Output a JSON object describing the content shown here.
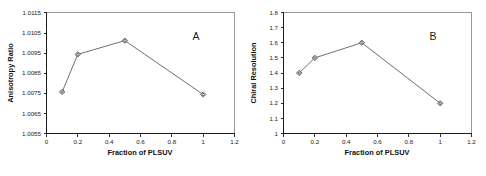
{
  "figure": {
    "width": 486,
    "height": 176,
    "background": "#ffffff",
    "line_color": "#55555a",
    "marker_color": "#4a4a50",
    "axis_color": "#1a1a1a"
  },
  "panels": [
    {
      "letter": "A",
      "name": "panel-a"
    },
    {
      "letter": "B",
      "name": "panel-b"
    }
  ],
  "chart_data": [
    {
      "type": "line",
      "title": "A",
      "xlabel": "Fraction of PLSUV",
      "ylabel": "Anisotropy Ratio",
      "xlim": [
        0,
        1.2
      ],
      "ylim": [
        1.0055,
        1.0115
      ],
      "xticks": [
        0,
        0.2,
        0.4,
        0.6,
        0.8,
        1,
        1.2
      ],
      "xticklabels": [
        "0",
        "0.2",
        "0.4",
        "0.6",
        "0.8",
        "1",
        "1.2"
      ],
      "yticks": [
        1.0055,
        1.0065,
        1.0075,
        1.0085,
        1.0095,
        1.0105,
        1.0115
      ],
      "yticklabels": [
        "1.0055",
        "1.0065",
        "1.0075",
        "1.0085",
        "1.0095",
        "1.0105",
        "1.0115"
      ],
      "grid": false,
      "legend": false,
      "marker": "open-diamond",
      "x": [
        0.1,
        0.2,
        0.5,
        1
      ],
      "values": [
        1.00757,
        1.00944,
        1.01012,
        1.00744
      ]
    },
    {
      "type": "line",
      "title": "B",
      "xlabel": "Fraction of PLSUV",
      "ylabel": "Chiral Resolution",
      "xlim": [
        0,
        1.2
      ],
      "ylim": [
        1,
        1.8
      ],
      "xticks": [
        0,
        0.2,
        0.4,
        0.6,
        0.8,
        1,
        1.2
      ],
      "xticklabels": [
        "0",
        "0.2",
        "0.4",
        "0.6",
        "0.8",
        "1",
        "1.2"
      ],
      "yticks": [
        1,
        1.1,
        1.2,
        1.3,
        1.4,
        1.5,
        1.6,
        1.7,
        1.8
      ],
      "yticklabels": [
        "1",
        "1.1",
        "1.2",
        "1.3",
        "1.4",
        "1.5",
        "1.6",
        "1.7",
        "1.8"
      ],
      "grid": false,
      "legend": false,
      "marker": "open-diamond",
      "x": [
        0.1,
        0.2,
        0.5,
        1
      ],
      "values": [
        1.4,
        1.5,
        1.6,
        1.2
      ]
    }
  ]
}
